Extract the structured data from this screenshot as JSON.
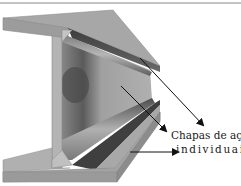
{
  "diagram": {
    "annotation": {
      "line1": "Chapas de aço",
      "line2": "individuais"
    },
    "arrows": [
      {
        "target": "top flange plate",
        "from": [
          140,
          58
        ],
        "to": [
          203,
          125
        ]
      },
      {
        "target": "web plate",
        "from": [
          121,
          86
        ],
        "to": [
          166,
          131
        ]
      },
      {
        "target": "bottom flange plate",
        "from": [
          130,
          152
        ],
        "to": [
          178,
          152
        ]
      }
    ],
    "colors": {
      "background": "#ffffff",
      "flange_face": "#a9a9a9",
      "flange_top": "#9e9e9e",
      "dark_shadow": "#4a4a4a",
      "web": "#a3a3a3",
      "arrow": "#111111",
      "text": "#1a1a1a"
    }
  }
}
